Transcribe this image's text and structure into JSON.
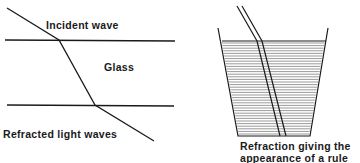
{
  "left_diagram": {
    "incident_label": "Incident wave",
    "medium_label": "Glass",
    "refracted_label": "Refracted light waves"
  },
  "right_diagram": {
    "caption_line1": "Refraction giving the",
    "caption_line2": "appearance of a rule"
  },
  "colors": {
    "line": "#1a1a1a",
    "water_hatch": "#555555"
  }
}
